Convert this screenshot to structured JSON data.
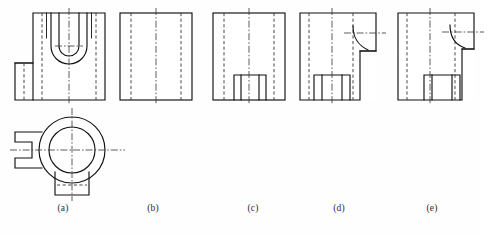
{
  "sheet": {
    "width": 481,
    "height": 235,
    "background": "#fefefe",
    "line_color": "#111111",
    "hidden_line_color": "#333333",
    "center_line_color": "#333333",
    "description": "Engineering drawing exercise: five orthographic front-view variants (a)-(e) of a cylindrical block with a U-shaped slot, plus one top view."
  },
  "captions": [
    {
      "id": "a",
      "label": "(a)",
      "x": 63,
      "y": 207
    },
    {
      "id": "b",
      "label": "(b)",
      "x": 153,
      "y": 207
    },
    {
      "id": "c",
      "label": "(c)",
      "x": 253,
      "y": 207
    },
    {
      "id": "d",
      "label": "(d)",
      "x": 339,
      "y": 207
    },
    {
      "id": "e",
      "label": "(e)",
      "x": 432,
      "y": 207
    }
  ],
  "views": {
    "a_front": {
      "name": "view-a-front",
      "caption": "(a)",
      "origin_x": 15,
      "origin_y": 8,
      "body": {
        "x": 18,
        "y": 5,
        "w": 72,
        "h": 87
      },
      "lug": {
        "x": 0,
        "y": 55,
        "w": 30,
        "h": 30
      },
      "features": [
        "rectangular outer body",
        "left rectangular lug",
        "U-shaped slot with rounded bottom, double contour",
        "two hidden vertical lines",
        "vertical center line"
      ]
    },
    "b_front": {
      "name": "view-b-front",
      "caption": "(b)",
      "origin_x": 120,
      "origin_y": 13,
      "body": {
        "x": 0,
        "y": 0,
        "w": 72,
        "h": 87
      },
      "features": [
        "plain rectangle",
        "two hidden vertical lines",
        "vertical center line"
      ]
    },
    "c_front": {
      "name": "view-c-front",
      "caption": "(c)",
      "origin_x": 213,
      "origin_y": 13,
      "body": {
        "x": 0,
        "y": 0,
        "w": 72,
        "h": 87
      },
      "notch": {
        "x": 21,
        "y": 62,
        "w": 32,
        "h": 25
      },
      "features": [
        "plain rectangle",
        "two hidden vertical lines",
        "vertical center line",
        "solid rectangular notch at bottom centre with internal vertical edges"
      ]
    },
    "d_front": {
      "name": "view-d-front",
      "caption": "(d)",
      "origin_x": 300,
      "origin_y": 13,
      "body": {
        "x": 0,
        "y": 0,
        "w": 76,
        "h": 87
      },
      "notch": {
        "x": 14,
        "y": 62,
        "w": 36,
        "h": 25
      },
      "step": {
        "x": 52,
        "y": 0,
        "w": 24,
        "h": 38
      },
      "features": [
        "rectangular body",
        "stepped cut at upper-right with concave fillet arc",
        "horizontal centre line through the step",
        "solid rectangular notch at bottom with internal vertical edges",
        "hidden vertical lines"
      ]
    },
    "e_front": {
      "name": "view-e-front",
      "caption": "(e)",
      "origin_x": 398,
      "origin_y": 13,
      "body": {
        "x": 0,
        "y": 0,
        "w": 76,
        "h": 87
      },
      "notch": {
        "x": 26,
        "y": 62,
        "w": 36,
        "h": 25
      },
      "step": {
        "x": 56,
        "y": 0,
        "w": 20,
        "h": 36
      },
      "features": [
        "rectangular body",
        "stepped cut at upper-right with convex fillet arc",
        "horizontal centre line through the step",
        "solid rectangular notch at bottom with internal vertical edges",
        "hidden vertical lines"
      ]
    },
    "a_top": {
      "name": "view-a-top",
      "caption": "",
      "origin_x": 10,
      "origin_y": 108,
      "outer_circle": {
        "cx": 62,
        "cy": 42,
        "r": 33
      },
      "inner_circle": {
        "cx": 62,
        "cy": 42,
        "r": 23
      },
      "left_lug": {
        "x": 5,
        "y": 24,
        "w": 27,
        "h": 36
      },
      "bottom_tab": {
        "x": 45,
        "y": 68,
        "w": 34,
        "h": 19
      },
      "features": [
        "outer circle",
        "concentric inner circle",
        "left rectangular lug with central slot notch",
        "bottom rectangular tab with hidden centre line",
        "horizontal and vertical centre lines"
      ]
    }
  }
}
